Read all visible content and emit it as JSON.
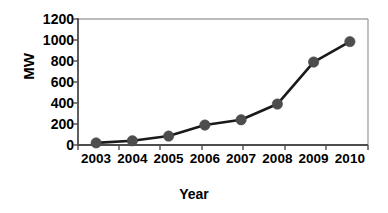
{
  "chart_data": {
    "type": "line",
    "title": "",
    "xlabel": "Year",
    "ylabel": "MW",
    "categories": [
      "2003",
      "2004",
      "2005",
      "2006",
      "2007",
      "2008",
      "2009",
      "2010"
    ],
    "x": [
      2003,
      2004,
      2005,
      2006,
      2007,
      2008,
      2009,
      2010
    ],
    "values": [
      20,
      40,
      85,
      190,
      240,
      390,
      790,
      985
    ],
    "series": [
      {
        "name": "MW",
        "values": [
          20,
          40,
          85,
          190,
          240,
          390,
          790,
          985
        ]
      }
    ],
    "ylim": [
      0,
      1200
    ],
    "yticks": [
      "0",
      "200",
      "400",
      "600",
      "800",
      "1000",
      "1200"
    ],
    "ytick_values": [
      0,
      200,
      400,
      600,
      800,
      1000,
      1200
    ],
    "xtick_labels": [
      "2003",
      "2004",
      "2005",
      "2006",
      "2007",
      "2008",
      "2009",
      "2010"
    ],
    "grid": false,
    "legend": "none",
    "line_color": "#1a1a1a",
    "marker_color": "#4d4d4d",
    "axis_color": "#555555",
    "plot_border_color": "#a6a6a6",
    "background": "#ffffff"
  },
  "axes": {
    "y_title": "MW",
    "x_title": "Year"
  }
}
